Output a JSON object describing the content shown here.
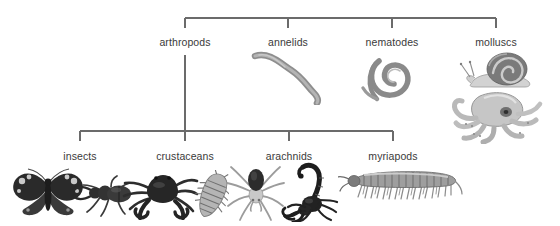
{
  "diagram": {
    "type": "cladogram",
    "background_color": "#ffffff",
    "line_color": "#6b6b6b",
    "text_color": "#3a3a3a",
    "levels": [
      {
        "level": 1,
        "name": "phyla-row",
        "nodes": [
          {
            "id": "arthropods",
            "label": "arthropods",
            "x": 185,
            "label_y": 36,
            "has_children": true,
            "organisms": []
          },
          {
            "id": "annelids",
            "label": "annelids",
            "x": 288,
            "label_y": 36,
            "has_children": false,
            "organisms": [
              {
                "name": "earthworm",
                "icon": "earthworm-illustration"
              }
            ]
          },
          {
            "id": "nematodes",
            "label": "nematodes",
            "x": 392,
            "label_y": 36,
            "has_children": false,
            "organisms": [
              {
                "name": "roundworm",
                "icon": "coiled-nematode-illustration"
              }
            ]
          },
          {
            "id": "molluscs",
            "label": "molluscs",
            "x": 496,
            "label_y": 36,
            "has_children": false,
            "organisms": [
              {
                "name": "snail",
                "icon": "snail-illustration"
              },
              {
                "name": "octopus",
                "icon": "octopus-illustration"
              }
            ]
          }
        ]
      },
      {
        "level": 2,
        "name": "arthropod-subgroups-row",
        "parent": "arthropods",
        "nodes": [
          {
            "id": "insects",
            "label": "insects",
            "x": 80,
            "label_y": 150,
            "has_children": false,
            "organisms": [
              {
                "name": "butterfly",
                "icon": "butterfly-illustration"
              },
              {
                "name": "stag-beetle",
                "icon": "stag-beetle-illustration"
              }
            ]
          },
          {
            "id": "crustaceans",
            "label": "crustaceans",
            "x": 185,
            "label_y": 150,
            "has_children": false,
            "organisms": [
              {
                "name": "crab",
                "icon": "crab-illustration"
              },
              {
                "name": "woodlouse",
                "icon": "woodlouse-illustration"
              }
            ]
          },
          {
            "id": "arachnids",
            "label": "arachnids",
            "x": 289,
            "label_y": 150,
            "has_children": false,
            "organisms": [
              {
                "name": "spider",
                "icon": "spider-illustration"
              },
              {
                "name": "scorpion",
                "icon": "scorpion-illustration"
              }
            ]
          },
          {
            "id": "myriapods",
            "label": "myriapods",
            "x": 393,
            "label_y": 150,
            "has_children": false,
            "organisms": [
              {
                "name": "millipede",
                "icon": "millipede-illustration"
              }
            ]
          }
        ]
      }
    ],
    "connectors": {
      "top_bar": {
        "y": 18,
        "x_start": 185,
        "x_end": 496,
        "tick_bottom": 28
      },
      "trunk": {
        "x": 185,
        "y_start": 55,
        "y_end": 131
      },
      "bottom_bar": {
        "y": 131,
        "x_start": 80,
        "x_end": 393,
        "tick_bottom": 141
      }
    }
  }
}
